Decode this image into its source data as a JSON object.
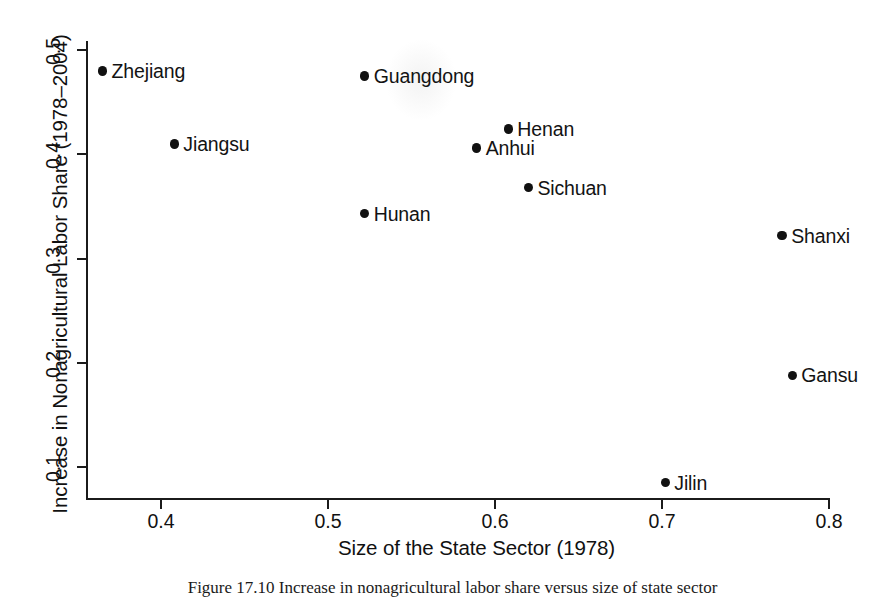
{
  "chart_data": {
    "type": "scatter",
    "title": "",
    "xlabel": "Size of the State Sector (1978)",
    "ylabel": "Increase in Nonagricultural Labor Share (1978–2004)",
    "xlim": [
      0.345,
      0.805
    ],
    "ylim": [
      0.065,
      0.515
    ],
    "xticks": [
      "0.4",
      "0.5",
      "0.6",
      "0.7",
      "0.8"
    ],
    "xtick_values": [
      0.4,
      0.5,
      0.6,
      0.7,
      0.8
    ],
    "yticks": [
      "0.1",
      "0.2",
      "0.3",
      "0.4",
      "0.5"
    ],
    "ytick_values": [
      0.1,
      0.2,
      0.3,
      0.4,
      0.5
    ],
    "grid": false,
    "legend": "none",
    "marker_color": "#111111",
    "points": [
      {
        "label": "Zhejiang",
        "x": 0.365,
        "y": 0.48,
        "label_side": "right"
      },
      {
        "label": "Jiangsu",
        "x": 0.408,
        "y": 0.41,
        "label_side": "right"
      },
      {
        "label": "Guangdong",
        "x": 0.522,
        "y": 0.475,
        "label_side": "right"
      },
      {
        "label": "Hunan",
        "x": 0.522,
        "y": 0.343,
        "label_side": "right"
      },
      {
        "label": "Anhui",
        "x": 0.589,
        "y": 0.406,
        "label_side": "right"
      },
      {
        "label": "Henan",
        "x": 0.608,
        "y": 0.424,
        "label_side": "right"
      },
      {
        "label": "Sichuan",
        "x": 0.62,
        "y": 0.368,
        "label_side": "right"
      },
      {
        "label": "Shanxi",
        "x": 0.772,
        "y": 0.322,
        "label_side": "right"
      },
      {
        "label": "Gansu",
        "x": 0.778,
        "y": 0.188,
        "label_side": "right"
      },
      {
        "label": "Jilin",
        "x": 0.702,
        "y": 0.085,
        "label_side": "right"
      }
    ]
  },
  "caption": {
    "text": "Figure 17.10  Increase in nonagricultural labor share versus size of state sector"
  }
}
